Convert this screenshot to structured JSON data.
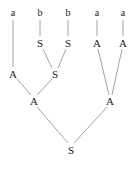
{
  "figure": {
    "name": "parse-tree",
    "background_color": "#ffffff",
    "edge_color": "#8a8a8a",
    "text_color": "#1a1a1a",
    "width": 136,
    "height": 172
  },
  "nodes": [
    {
      "id": "t0",
      "label": "a",
      "kind": "terminal",
      "x": 13,
      "y": 13
    },
    {
      "id": "t1",
      "label": "b",
      "kind": "terminal",
      "x": 40,
      "y": 13
    },
    {
      "id": "t2",
      "label": "b",
      "kind": "terminal",
      "x": 68,
      "y": 13
    },
    {
      "id": "t3",
      "label": "a",
      "kind": "terminal",
      "x": 97,
      "y": 13
    },
    {
      "id": "t4",
      "label": "a",
      "kind": "terminal",
      "x": 123,
      "y": 13
    },
    {
      "id": "n0",
      "label": "S",
      "kind": "nonterminal",
      "x": 40,
      "y": 43
    },
    {
      "id": "n1",
      "label": "S",
      "kind": "nonterminal",
      "x": 68,
      "y": 43
    },
    {
      "id": "n2",
      "label": "A",
      "kind": "nonterminal",
      "x": 97,
      "y": 43
    },
    {
      "id": "n3",
      "label": "A",
      "kind": "nonterminal",
      "x": 123,
      "y": 43
    },
    {
      "id": "n4",
      "label": "A",
      "kind": "nonterminal",
      "x": 13,
      "y": 74
    },
    {
      "id": "n5",
      "label": "S",
      "kind": "nonterminal",
      "x": 55,
      "y": 74
    },
    {
      "id": "n6",
      "label": "A",
      "kind": "nonterminal",
      "x": 34,
      "y": 101
    },
    {
      "id": "n7",
      "label": "A",
      "kind": "nonterminal",
      "x": 110,
      "y": 101
    },
    {
      "id": "n8",
      "label": "S",
      "kind": "root",
      "x": 71,
      "y": 150
    }
  ],
  "edges": [
    {
      "id": "e0",
      "from": "t0",
      "to": "n4",
      "x1": 13,
      "y1": 20,
      "x2": 13,
      "y2": 67
    },
    {
      "id": "e1",
      "from": "t1",
      "to": "n0",
      "x1": 40,
      "y1": 20,
      "x2": 40,
      "y2": 36
    },
    {
      "id": "e2",
      "from": "t2",
      "to": "n1",
      "x1": 68,
      "y1": 20,
      "x2": 68,
      "y2": 36
    },
    {
      "id": "e3",
      "from": "t3",
      "to": "n2",
      "x1": 97,
      "y1": 20,
      "x2": 97,
      "y2": 36
    },
    {
      "id": "e4",
      "from": "t4",
      "to": "n3",
      "x1": 123,
      "y1": 20,
      "x2": 123,
      "y2": 36
    },
    {
      "id": "e5",
      "from": "n0",
      "to": "n5",
      "x1": 43,
      "y1": 49,
      "x2": 52,
      "y2": 68
    },
    {
      "id": "e6",
      "from": "n1",
      "to": "n5",
      "x1": 66,
      "y1": 49,
      "x2": 58,
      "y2": 68
    },
    {
      "id": "e7",
      "from": "n2",
      "to": "n7",
      "x1": 98,
      "y1": 49,
      "x2": 109,
      "y2": 95
    },
    {
      "id": "e8",
      "from": "n3",
      "to": "n7",
      "x1": 122,
      "y1": 49,
      "x2": 112,
      "y2": 95
    },
    {
      "id": "e9",
      "from": "n4",
      "to": "n6",
      "x1": 17,
      "y1": 79,
      "x2": 31,
      "y2": 95
    },
    {
      "id": "e10",
      "from": "n5",
      "to": "n6",
      "x1": 52,
      "y1": 79,
      "x2": 37,
      "y2": 95
    },
    {
      "id": "e11",
      "from": "n6",
      "to": "n8",
      "x1": 37,
      "y1": 107,
      "x2": 68,
      "y2": 143
    },
    {
      "id": "e12",
      "from": "n7",
      "to": "n8",
      "x1": 107,
      "y1": 107,
      "x2": 74,
      "y2": 143
    }
  ]
}
